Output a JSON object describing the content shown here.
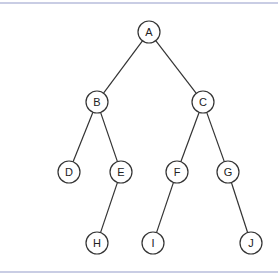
{
  "diagram": {
    "type": "binary-tree",
    "border_color": "#c9cde4",
    "node_stroke": "#333333",
    "nodes": [
      {
        "id": "A",
        "label": "A",
        "x": 149,
        "y": 32
      },
      {
        "id": "B",
        "label": "B",
        "x": 97,
        "y": 102
      },
      {
        "id": "C",
        "label": "C",
        "x": 203,
        "y": 102
      },
      {
        "id": "D",
        "label": "D",
        "x": 69,
        "y": 172
      },
      {
        "id": "E",
        "label": "E",
        "x": 121,
        "y": 172
      },
      {
        "id": "F",
        "label": "F",
        "x": 177,
        "y": 172
      },
      {
        "id": "G",
        "label": "G",
        "x": 228,
        "y": 172
      },
      {
        "id": "H",
        "label": "H",
        "x": 97,
        "y": 243
      },
      {
        "id": "I",
        "label": "I",
        "x": 153,
        "y": 243
      },
      {
        "id": "J",
        "label": "J",
        "x": 251,
        "y": 243
      }
    ],
    "edges": [
      [
        "A",
        "B"
      ],
      [
        "A",
        "C"
      ],
      [
        "B",
        "D"
      ],
      [
        "B",
        "E"
      ],
      [
        "C",
        "F"
      ],
      [
        "C",
        "G"
      ],
      [
        "E",
        "H"
      ],
      [
        "F",
        "I"
      ],
      [
        "G",
        "J"
      ]
    ]
  }
}
